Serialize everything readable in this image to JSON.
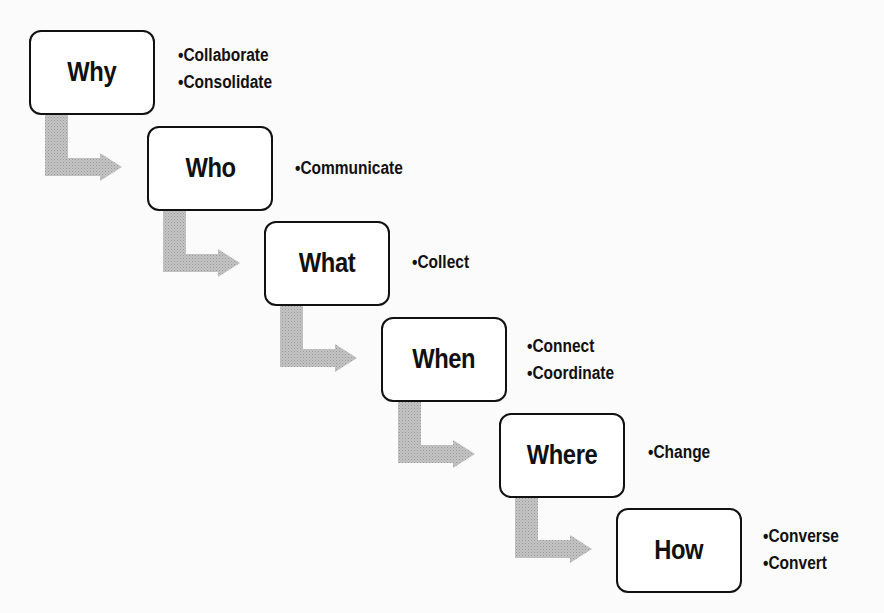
{
  "diagram": {
    "title": "",
    "colors": {
      "box_border": "#111111",
      "box_fill": "#ffffff",
      "arrow_fill": "#b8b8b8",
      "text": "#111111",
      "background": "#fbfbfb"
    },
    "steps": [
      {
        "label": "Why",
        "bullets": [
          "Collaborate",
          "Consolidate"
        ]
      },
      {
        "label": "Who",
        "bullets": [
          "Communicate"
        ]
      },
      {
        "label": "What",
        "bullets": [
          "Collect"
        ]
      },
      {
        "label": "When",
        "bullets": [
          "Connect",
          "Coordinate"
        ]
      },
      {
        "label": "Where",
        "bullets": [
          "Change"
        ]
      },
      {
        "label": "How",
        "bullets": [
          "Converse",
          "Convert"
        ]
      }
    ]
  }
}
